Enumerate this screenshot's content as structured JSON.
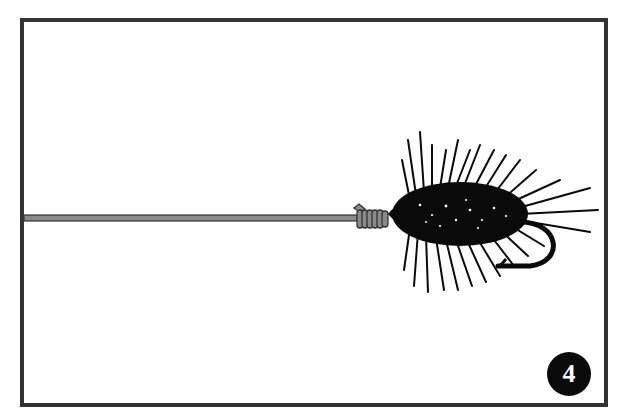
{
  "illustration": {
    "subject": "fly-fishing line tied to a hackled fly hook",
    "step_number": "4",
    "colors": {
      "frame": "#333333",
      "line": "#8a8a8a",
      "line_outline": "#333333",
      "fly": "#0a0a0a",
      "badge_bg": "#0a0a0a",
      "badge_text": "#ffffff",
      "background": "#ffffff"
    }
  }
}
